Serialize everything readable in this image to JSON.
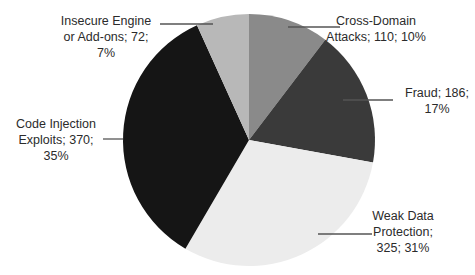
{
  "chart_data": {
    "type": "pie",
    "title": "",
    "start_angle_deg": 0,
    "direction": "clockwise",
    "total": 1063,
    "slices": [
      {
        "label": "Cross-Domain Attacks",
        "value": 110,
        "percent": "10%",
        "color": "#8a8a8a",
        "text_lines": [
          "Cross-Domain",
          "Attacks; 110; 10%"
        ]
      },
      {
        "label": "Fraud",
        "value": 186,
        "percent": "17%",
        "color": "#3a3a3a",
        "text_lines": [
          "Fraud; 186;",
          "17%"
        ]
      },
      {
        "label": "Weak Data Protection",
        "value": 325,
        "percent": "31%",
        "color": "#ececec",
        "text_lines": [
          "Weak Data",
          "Protection;",
          "325; 31%"
        ]
      },
      {
        "label": "Code Injection Exploits",
        "value": 370,
        "percent": "35%",
        "color": "#151515",
        "text_lines": [
          "Code Injection",
          "Exploits; 370;",
          "35%"
        ]
      },
      {
        "label": "Insecure Engine or Add-ons",
        "value": 72,
        "percent": "7%",
        "color": "#b8b8b8",
        "text_lines": [
          "Insecure Engine",
          "or Add-ons; 72;",
          "7%"
        ]
      }
    ],
    "legend": "none (data labels with leader lines)"
  },
  "layout": {
    "center": [
      249,
      140
    ],
    "radius": 126,
    "leaders": [
      {
        "x1": 288,
        "y1": 27,
        "x2": 340,
        "y2": 27
      },
      {
        "x1": 343,
        "y1": 100,
        "x2": 393,
        "y2": 100
      },
      {
        "x1": 318,
        "y1": 234,
        "x2": 372,
        "y2": 234
      },
      {
        "x1": 103,
        "y1": 139,
        "x2": 123,
        "y2": 139
      },
      {
        "x1": 160,
        "y1": 24,
        "x2": 213,
        "y2": 24
      }
    ],
    "label_pos": [
      {
        "x": 376,
        "y": 13
      },
      {
        "x": 437,
        "y": 85
      },
      {
        "x": 403,
        "y": 208
      },
      {
        "x": 56,
        "y": 116
      },
      {
        "x": 106,
        "y": 13
      }
    ]
  }
}
